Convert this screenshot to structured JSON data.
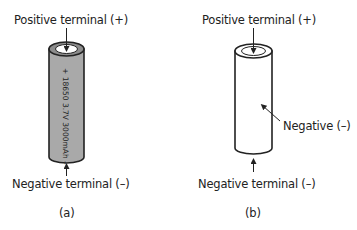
{
  "figure_a": {
    "positive_label": "Positive terminal (+)",
    "negative_label": "Negative terminal (–)",
    "battery_text": "+ 18650  3.7V  3000mAh –",
    "caption": "(a)",
    "body_color": "#a9a9a9"
  },
  "figure_b": {
    "positive_label": "Positive terminal (+)",
    "negative_label": "Negative terminal (–)",
    "side_label": "Negative (–)",
    "caption": "(b)",
    "body_color": "#ffffff"
  }
}
